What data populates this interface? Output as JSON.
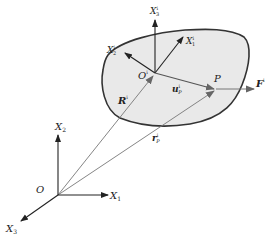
{
  "diagram": {
    "colors": {
      "body_fill": "#e9e9e9",
      "body_stroke": "#333333",
      "axis": "#222222",
      "vector": "#555555",
      "ray": "#777777"
    },
    "global_frame": {
      "origin_label": "O",
      "x1_label": "X",
      "x1_sub": "1",
      "x2_label": "X",
      "x2_sub": "2",
      "x3_label": "X",
      "x3_sub": "3"
    },
    "body_frame": {
      "origin_label": "O",
      "origin_sup": "i",
      "x1_label": "X",
      "x1_sub": "1",
      "x1_sup": "i",
      "x2_label": "X",
      "x2_sub": "2",
      "x2_sup": "i",
      "x3_label": "X",
      "x3_sub": "3",
      "x3_sup": "i"
    },
    "vectors": {
      "R_label": "R",
      "R_sup": "i",
      "r_label": "r",
      "r_sub": "P",
      "r_sup": "i",
      "u_label": "u",
      "u_sub": "P",
      "u_sup": "i",
      "F_label": "F",
      "F_sup": "i"
    },
    "point_label": "P"
  }
}
